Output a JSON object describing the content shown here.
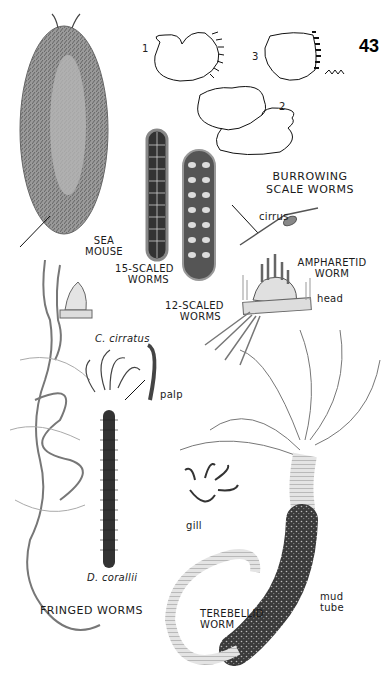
{
  "page": {
    "page_number": "43",
    "background": "#ffffff",
    "ink": "#1a1a1a"
  },
  "figures": {
    "sea_mouse": {
      "label_line1": "SEA",
      "label_line2": "MOUSE"
    },
    "scaled_15": {
      "label_line1": "15-SCALED",
      "label_line2": "WORMS"
    },
    "scaled_12": {
      "label_line1": "12-SCALED",
      "label_line2": "WORMS"
    },
    "burrowing": {
      "title_line1": "BURROWING",
      "title_line2": "SCALE WORMS",
      "diagrams": [
        {
          "number": "1"
        },
        {
          "number": "2"
        },
        {
          "number": "3"
        }
      ]
    },
    "cirrus": {
      "label": "cirrus"
    },
    "ampharetid": {
      "label_line1": "AMPHARETID",
      "label_line2": "WORM",
      "head_label": "head"
    },
    "fringed": {
      "species1": "C. cirratus",
      "species2": "D. corallii",
      "palp_label": "palp",
      "title": "FRINGED WORMS"
    },
    "terebellid": {
      "label_line1": "TEREBELLID",
      "label_line2": "WORM",
      "gill_label": "gill",
      "tube_line1": "mud",
      "tube_line2": "tube"
    }
  }
}
